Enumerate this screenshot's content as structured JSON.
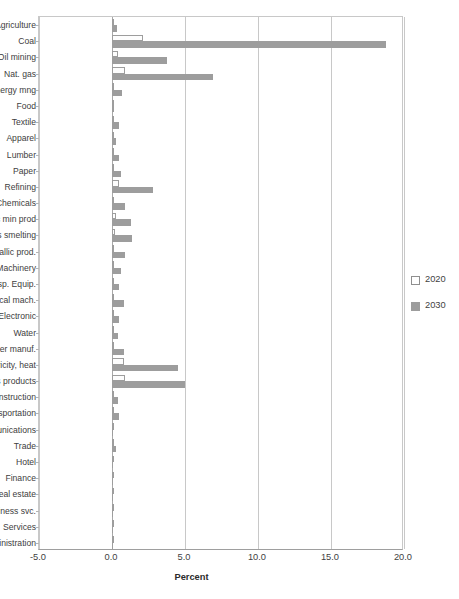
{
  "chart_data": {
    "type": "bar",
    "orientation": "horizontal",
    "title": "",
    "xlabel": "Percent",
    "ylabel": "",
    "xlim": [
      -5.0,
      20.0
    ],
    "xticks": [
      "-5.0",
      "0.0",
      "5.0",
      "10.0",
      "15.0",
      "20.0"
    ],
    "xtick_values": [
      -5.0,
      0.0,
      5.0,
      10.0,
      15.0,
      20.0
    ],
    "grid": true,
    "legend_position": "right",
    "categories": [
      "Agriculture",
      "Coal",
      "Oil mining",
      "Nat. gas",
      "Nonenergy mng",
      "Food",
      "Textile",
      "Apparel",
      "Lumber",
      "Paper",
      "Refining",
      "Chemicals",
      "Nonmetallic min prod",
      "Metals smelting",
      "Metallic prod.",
      "Machinery",
      "Transp. Equip.",
      "Electrical mach.",
      "Electronic",
      "Water",
      "Other manuf.",
      "Electricity, heat",
      "Gas products",
      "Construction",
      "Transportation",
      "Communications",
      "Trade",
      "Hotel",
      "Finance",
      "Real estate",
      "Business svc.",
      "Services",
      "Administration"
    ],
    "series": [
      {
        "name": "2020",
        "color": "#ffffff",
        "edge_color": "#9d9d9d",
        "values": [
          0.05,
          2.1,
          0.4,
          0.9,
          0.1,
          0.03,
          0.05,
          0.03,
          0.05,
          0.07,
          0.5,
          0.1,
          0.25,
          0.2,
          0.07,
          0.05,
          0.05,
          0.07,
          0.05,
          0.05,
          0.07,
          0.8,
          0.9,
          0.05,
          0.05,
          0.02,
          0.05,
          0.02,
          0.02,
          0.01,
          0.02,
          0.01,
          0.01
        ]
      },
      {
        "name": "2030",
        "color": "#9d9d9d",
        "edge_color": "#9d9d9d",
        "values": [
          0.35,
          18.8,
          3.8,
          6.9,
          0.7,
          0.15,
          0.45,
          0.25,
          0.5,
          0.6,
          2.8,
          0.9,
          1.3,
          1.4,
          0.9,
          0.6,
          0.5,
          0.8,
          0.5,
          0.4,
          0.8,
          4.5,
          5.0,
          0.4,
          0.5,
          0.05,
          0.3,
          0.08,
          0.05,
          0.03,
          0.08,
          0.05,
          0.03
        ]
      }
    ]
  },
  "legend": {
    "items": [
      {
        "label": "2020",
        "style": "hollow"
      },
      {
        "label": "2030",
        "style": "filled"
      }
    ]
  }
}
